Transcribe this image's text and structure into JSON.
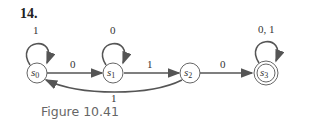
{
  "problem_number": "14.",
  "caption": "Figure 10.41",
  "states": [
    {
      "id": "s0",
      "base": "s",
      "sub": "0",
      "accepting": false
    },
    {
      "id": "s1",
      "base": "s",
      "sub": "1",
      "accepting": false
    },
    {
      "id": "s2",
      "base": "s",
      "sub": "2",
      "accepting": false
    },
    {
      "id": "s3",
      "base": "s",
      "sub": "3",
      "accepting": true
    }
  ],
  "transitions": [
    {
      "from": "s0",
      "to": "s0",
      "label": "1"
    },
    {
      "from": "s0",
      "to": "s1",
      "label": "0"
    },
    {
      "from": "s1",
      "to": "s1",
      "label": "0"
    },
    {
      "from": "s1",
      "to": "s2",
      "label": "1"
    },
    {
      "from": "s2",
      "to": "s0",
      "label": "1"
    },
    {
      "from": "s2",
      "to": "s3",
      "label": "0"
    },
    {
      "from": "s3",
      "to": "s3",
      "label": "0, 1"
    }
  ]
}
